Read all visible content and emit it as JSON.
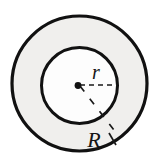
{
  "figure": {
    "name": "concentric-circles-annulus",
    "background_color": "#ffffff",
    "width": 165,
    "height": 163
  },
  "shapes": {
    "outer_circle": {
      "label": "R",
      "cx": 79.5,
      "cy": 83.5,
      "radius": 67.5,
      "fill_color": "#f0efed",
      "stroke_color": "#111111",
      "stroke_width": 3.2
    },
    "inner_circle": {
      "label": "r",
      "cx": 79.5,
      "cy": 85.5,
      "radius": 38.0,
      "fill_color": "#fdfdfd",
      "stroke_color": "#111111",
      "stroke_width": 3.0
    },
    "center_point": {
      "cx": 78.0,
      "cy": 85.5,
      "radius": 3.4,
      "color": "#111111"
    }
  },
  "labels": {
    "inner_radius": {
      "text": "r",
      "x": 96,
      "y": 79
    },
    "outer_radius": {
      "text": "R",
      "x": 94,
      "y": 147
    }
  },
  "leader_lines": {
    "inner_radius_line": {
      "x1": 80,
      "y1": 85,
      "x2": 117,
      "y2": 85,
      "dash": "5,4",
      "color": "#1a1a1a"
    },
    "outer_radius_line": {
      "x1": 80,
      "y1": 86,
      "x2": 117,
      "y2": 134,
      "dash": "7,9",
      "color": "#1a1a1a"
    },
    "label_tick": {
      "x1": 109,
      "y1": 133,
      "x2": 116,
      "y2": 144,
      "dash": "0",
      "color": "#1a1a1a"
    }
  }
}
